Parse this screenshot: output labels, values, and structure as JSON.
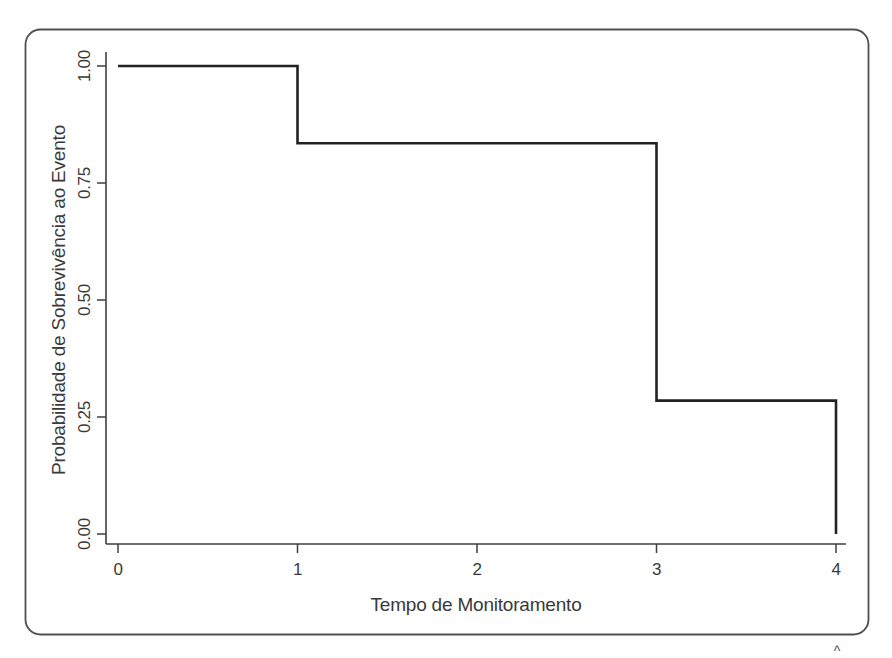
{
  "figure": {
    "caret": "^"
  },
  "chart_data": {
    "type": "line",
    "subtype": "kaplan-meier-step-function",
    "title": "",
    "xlabel": "Tempo de Monitoramento",
    "ylabel": "Probabilidade de Sobrevivência ao Evento",
    "x_tick_labels": [
      "0",
      "1",
      "2",
      "3",
      "4"
    ],
    "y_tick_labels": [
      "1.00",
      "0.75",
      "0.50",
      "0.25",
      "0.00"
    ],
    "xlim": [
      0,
      4
    ],
    "ylim": [
      0,
      1
    ],
    "grid": false,
    "legend": null,
    "line_color": "#222222",
    "axis_color": "#3f3f3f",
    "frame_color": "#4f4f4f",
    "text_color": "#3a3a3a",
    "points": [
      [
        0,
        1.0
      ],
      [
        1,
        1.0
      ],
      [
        1,
        0.835
      ],
      [
        3,
        0.835
      ],
      [
        3,
        0.285
      ],
      [
        4,
        0.285
      ],
      [
        4,
        0.0
      ]
    ],
    "steps": {
      "times": [
        0,
        1,
        3,
        4
      ],
      "survival_after": [
        1.0,
        0.835,
        0.285,
        0.0
      ]
    }
  }
}
